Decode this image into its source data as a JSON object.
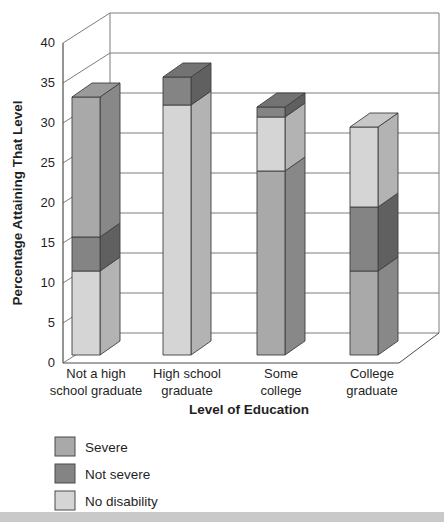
{
  "figure": {
    "background": "#ffffff",
    "bottom_strip_color": "#c9c9c9"
  },
  "chart_data": {
    "type": "bar",
    "variant": "3d-stacked-column",
    "title": "",
    "xlabel": "Level of Education",
    "ylabel": "Percentage Attaining That Level",
    "ylim": [
      0,
      40
    ],
    "ytick_step": 5,
    "yticks": [
      "0",
      "5",
      "10",
      "15",
      "20",
      "25",
      "30",
      "35",
      "40"
    ],
    "grid": true,
    "legend_position": "bottom-left",
    "categories": [
      "Not a high school graduate",
      "High school graduate",
      "Some college",
      "College graduate"
    ],
    "category_label_lines": [
      [
        "Not a high",
        "school graduate"
      ],
      [
        "High school",
        "graduate"
      ],
      [
        "Some",
        "college"
      ],
      [
        "College",
        "graduate"
      ]
    ],
    "legend": [
      {
        "label": "Severe",
        "group": "severe"
      },
      {
        "label": "Not severe",
        "group": "not_severe"
      },
      {
        "label": "No disability",
        "group": "no_disability"
      }
    ],
    "colors": {
      "severe": {
        "front": "#a9a9a9",
        "top": "#9a9a9a",
        "side": "#888888"
      },
      "not_severe": {
        "front": "#848484",
        "top": "#737373",
        "side": "#606060"
      },
      "no_disability": {
        "front": "#d5d5d5",
        "top": "#c7c7c7",
        "side": "#b3b3b3"
      }
    },
    "bars": [
      {
        "category": "Not a high school graduate",
        "segments_bottom_to_top": [
          {
            "group": "no_disability",
            "value": 10.5
          },
          {
            "group": "not_severe",
            "value": 4.25
          },
          {
            "group": "severe",
            "value": 17.5
          }
        ]
      },
      {
        "category": "High school graduate",
        "segments_bottom_to_top": [
          {
            "group": "no_disability",
            "value": 31.25
          },
          {
            "group": "not_severe",
            "value": 3.5
          }
        ]
      },
      {
        "category": "Some college",
        "segments_bottom_to_top": [
          {
            "group": "severe",
            "value": 23
          },
          {
            "group": "no_disability",
            "value": 6.75
          },
          {
            "group": "not_severe",
            "value": 1.25
          }
        ]
      },
      {
        "category": "College graduate",
        "segments_bottom_to_top": [
          {
            "group": "severe",
            "value": 10.5
          },
          {
            "group": "not_severe",
            "value": 8
          },
          {
            "group": "no_disability",
            "value": 10
          }
        ]
      }
    ]
  }
}
